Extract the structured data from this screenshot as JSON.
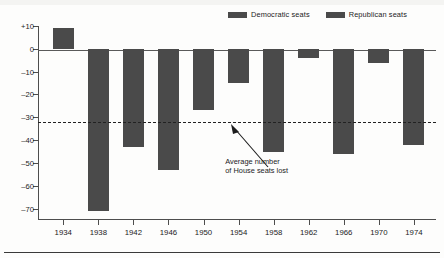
{
  "chart_data": {
    "type": "bar",
    "title": "",
    "subtitle": "",
    "xlabel": "",
    "ylabel": "",
    "categories": [
      "1934",
      "1938",
      "1942",
      "1946",
      "1950",
      "1954",
      "1958",
      "1962",
      "1966",
      "1970",
      "1974"
    ],
    "values": [
      9,
      -71,
      -43,
      -53,
      -27,
      -15,
      -45,
      -4,
      -46,
      -6,
      -42
    ],
    "series": [
      {
        "name": "House seats gained or lost by the President's party",
        "values": [
          9,
          -71,
          -43,
          -53,
          -27,
          -15,
          -45,
          -4,
          -46,
          -6,
          -42
        ]
      }
    ],
    "ylim": [
      -75,
      10
    ],
    "yticks": [
      10,
      0,
      -10,
      -20,
      -30,
      -40,
      -50,
      -60,
      -70
    ],
    "ytick_labels": [
      "+10",
      "0",
      "–10",
      "–20",
      "–30",
      "–40",
      "–50",
      "–60",
      "–70"
    ],
    "grid": false,
    "legend_position": "top-right",
    "bar_color": "#4a4a4a",
    "axis_color": "#4d4d4d",
    "background_color": "#fdfdfc",
    "reference_line": {
      "value": -32,
      "style": "dashed",
      "color": "#222222",
      "label_line1": "Average number",
      "label_line2": "of House seats lost"
    },
    "legend": [
      {
        "label": "Democratic seats",
        "color": "#4a4a4a"
      },
      {
        "label": "Republican seats",
        "color": "#4a4a4a"
      }
    ],
    "bar_party": [
      "Democratic",
      "Democratic",
      "Democratic",
      "Democratic",
      "Democratic",
      "Republican",
      "Republican",
      "Democratic",
      "Democratic",
      "Republican",
      "Republican"
    ]
  },
  "annotation": {
    "line1": "Average number",
    "line2": "of House seats lost"
  }
}
